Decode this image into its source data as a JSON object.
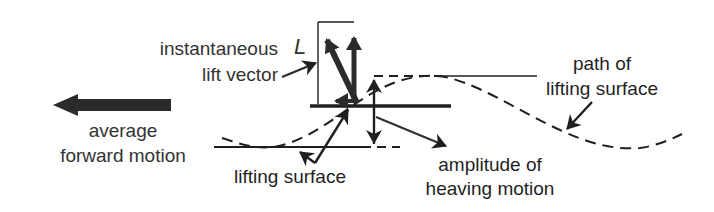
{
  "diagram": {
    "colors": {
      "ink": "#1f1f1f",
      "arrow_fill": "#2b2b2b",
      "text": "#333333",
      "background": "#ffffff"
    },
    "labels": {
      "lift_symbol": "L",
      "instantaneous_line1": "instantaneous",
      "instantaneous_line2": "lift vector",
      "average_line1": "average",
      "average_line2": "forward motion",
      "lifting_surface": "lifting surface",
      "amplitude_line1": "amplitude of",
      "amplitude_line2": "heaving motion",
      "path_line1": "path of",
      "path_line2": "lifting surface"
    },
    "elements": [
      {
        "name": "average-forward-motion-arrow",
        "direction": "left"
      },
      {
        "name": "lifting-surface-bar",
        "style": "solid horizontal"
      },
      {
        "name": "lift-vector-L",
        "style": "thick diagonal arrow"
      },
      {
        "name": "vertical-lift-component",
        "style": "thick vertical arrow"
      },
      {
        "name": "horizontal-thrust-component",
        "style": "thick horizontal arrow"
      },
      {
        "name": "amplitude-double-arrow",
        "style": "vertical double-headed arrow"
      },
      {
        "name": "path-of-lifting-surface",
        "style": "dashed sinusoid"
      }
    ]
  }
}
